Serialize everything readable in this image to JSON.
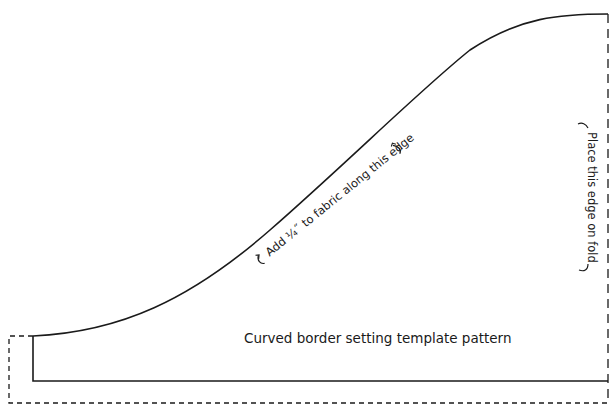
{
  "diagram": {
    "title": "Curved border setting template pattern",
    "curve_note": "Add ¼˝ to fabric along this edge",
    "fold_note": "Place this edge on fold",
    "colors": {
      "line": "#1a1a1a",
      "background": "#ffffff"
    }
  }
}
